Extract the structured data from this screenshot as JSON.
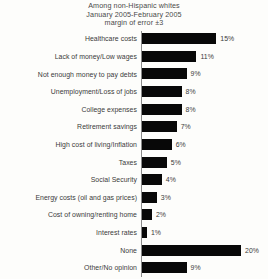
{
  "chart_data": {
    "type": "bar",
    "orientation": "horizontal",
    "title": "Among non-Hispanic whites\nJanuary 2005-February 2005\nmargin of error ±3",
    "title_lines": [
      "Among non-Hispanic whites",
      "January 2005-February 2005",
      "margin of error ±3"
    ],
    "xlabel": "",
    "ylabel": "",
    "xlim": [
      0,
      25
    ],
    "grid": false,
    "legend": null,
    "bar_color": "#080808",
    "background_color": "#fdfdfb",
    "value_suffix": "%",
    "categories": [
      "Healthcare costs",
      "Lack of money/Low wages",
      "Not enough money to pay debts",
      "Unemployment/Loss of jobs",
      "College expenses",
      "Retirement savings",
      "High cost of living/Inflation",
      "Taxes",
      "Social Security",
      "Energy costs (oil and gas prices)",
      "Cost of owning/renting home",
      "Interest rates",
      "None",
      "Other/No opinion"
    ],
    "values": [
      15,
      11,
      9,
      8,
      8,
      7,
      6,
      5,
      4,
      3,
      2,
      1,
      20,
      9
    ],
    "value_labels": [
      "15%",
      "11%",
      "9%",
      "8%",
      "8%",
      "7%",
      "6%",
      "5%",
      "4%",
      "3%",
      "2%",
      "1%",
      "20%",
      "9%"
    ],
    "bars": [
      {
        "label": "Healthcare costs",
        "value": 15,
        "value_label": "15%"
      },
      {
        "label": "Lack of money/Low wages",
        "value": 11,
        "value_label": "11%"
      },
      {
        "label": "Not enough money to pay debts",
        "value": 9,
        "value_label": "9%"
      },
      {
        "label": "Unemployment/Loss of jobs",
        "value": 8,
        "value_label": "8%"
      },
      {
        "label": "College expenses",
        "value": 8,
        "value_label": "8%"
      },
      {
        "label": "Retirement savings",
        "value": 7,
        "value_label": "7%"
      },
      {
        "label": "High cost of living/Inflation",
        "value": 6,
        "value_label": "6%"
      },
      {
        "label": "Taxes",
        "value": 5,
        "value_label": "5%"
      },
      {
        "label": "Social Security",
        "value": 4,
        "value_label": "4%"
      },
      {
        "label": "Energy costs (oil and gas prices)",
        "value": 3,
        "value_label": "3%"
      },
      {
        "label": "Cost of owning/renting home",
        "value": 2,
        "value_label": "2%"
      },
      {
        "label": "Interest rates",
        "value": 1,
        "value_label": "1%"
      },
      {
        "label": "None",
        "value": 20,
        "value_label": "20%"
      },
      {
        "label": "Other/No opinion",
        "value": 9,
        "value_label": "9%"
      }
    ]
  }
}
